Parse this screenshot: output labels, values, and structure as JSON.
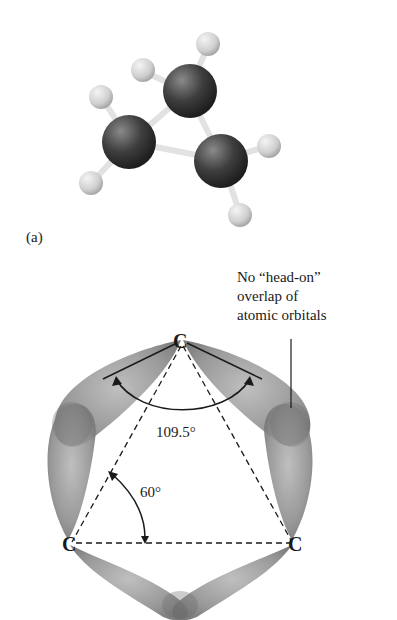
{
  "figure": {
    "panel_a": {
      "label": "(a)",
      "molecule": "cyclopropane ball-and-stick model",
      "atoms": {
        "carbon_count": 3,
        "hydrogen_count": 6
      },
      "colors": {
        "carbon": "#3a3a3a",
        "hydrogen": "#d8d8d8",
        "bond": "#e6e6e6"
      }
    },
    "panel_b": {
      "callout_lines": [
        "No “head-on”",
        "overlap of",
        "atomic orbitals"
      ],
      "atom_labels": {
        "top": "C",
        "left": "C",
        "right": "C"
      },
      "angles": {
        "tetrahedral": "109.5°",
        "ring": "60°"
      },
      "colors": {
        "orbital": "#8c8c8c",
        "orbital_overlap": "#6f6f6f",
        "lines": "#1a1a1a"
      }
    }
  }
}
